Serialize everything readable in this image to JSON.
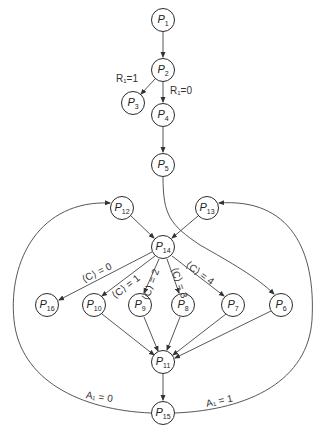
{
  "diagram": {
    "type": "flow-graph",
    "stroke_color": "#444444",
    "nodes": [
      {
        "id": "P1",
        "base": "P",
        "sub": "1",
        "x": 163,
        "y": 20
      },
      {
        "id": "P2",
        "base": "P",
        "sub": "2",
        "x": 163,
        "y": 70
      },
      {
        "id": "P3",
        "base": "P",
        "sub": "3",
        "x": 133,
        "y": 103
      },
      {
        "id": "P4",
        "base": "P",
        "sub": "4",
        "x": 163,
        "y": 115
      },
      {
        "id": "P5",
        "base": "P",
        "sub": "5",
        "x": 163,
        "y": 165
      },
      {
        "id": "P12",
        "base": "P",
        "sub": "12",
        "x": 122,
        "y": 208
      },
      {
        "id": "P13",
        "base": "P",
        "sub": "13",
        "x": 207,
        "y": 208
      },
      {
        "id": "P14",
        "base": "P",
        "sub": "14",
        "x": 163,
        "y": 247
      },
      {
        "id": "P16",
        "base": "P",
        "sub": "16",
        "x": 47,
        "y": 305
      },
      {
        "id": "P10",
        "base": "P",
        "sub": "10",
        "x": 94,
        "y": 305
      },
      {
        "id": "P9",
        "base": "P",
        "sub": "9",
        "x": 140,
        "y": 305
      },
      {
        "id": "P8",
        "base": "P",
        "sub": "8",
        "x": 183,
        "y": 305
      },
      {
        "id": "P7",
        "base": "P",
        "sub": "7",
        "x": 233,
        "y": 305
      },
      {
        "id": "P6",
        "base": "P",
        "sub": "6",
        "x": 281,
        "y": 305
      },
      {
        "id": "P11",
        "base": "P",
        "sub": "11",
        "x": 163,
        "y": 362
      },
      {
        "id": "P15",
        "base": "P",
        "sub": "15",
        "x": 163,
        "y": 413
      }
    ],
    "edge_labels": [
      {
        "id": "r1-1",
        "text": "R₁=1",
        "x": 116,
        "y": 79,
        "rot": 0
      },
      {
        "id": "r1-0",
        "text": "R₁=0",
        "x": 170,
        "y": 91,
        "rot": 0
      },
      {
        "id": "c0",
        "text": "⟨C⟩ = 0",
        "x": 84,
        "y": 275,
        "rot": -25
      },
      {
        "id": "c1",
        "text": "⟨C⟩ = 1",
        "x": 115,
        "y": 289,
        "rot": -38
      },
      {
        "id": "c2",
        "text": "⟨C⟩ = 2",
        "x": 143,
        "y": 290,
        "rot": -72
      },
      {
        "id": "c3",
        "text": "⟨C⟩ = 3",
        "x": 172,
        "y": 262,
        "rot": 72
      },
      {
        "id": "c4",
        "text": "⟨C⟩ = 4",
        "x": 190,
        "y": 259,
        "rot": 32
      },
      {
        "id": "a1-0",
        "text": "A₁ = 0",
        "x": 88,
        "y": 395,
        "rot": 10
      },
      {
        "id": "a1-1",
        "text": "A₁ = 1",
        "x": 210,
        "y": 398,
        "rot": -12
      }
    ]
  }
}
